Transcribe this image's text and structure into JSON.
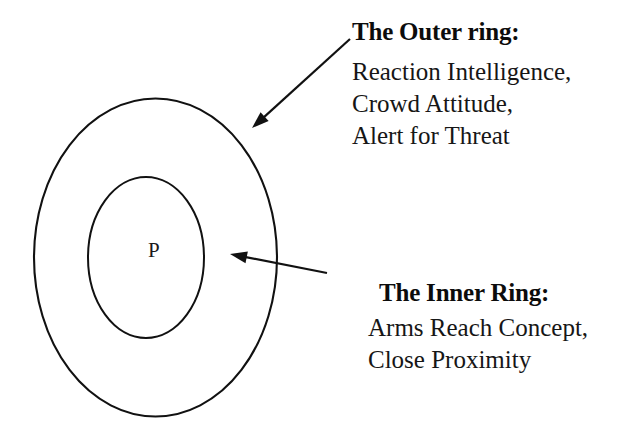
{
  "diagram": {
    "center_label": "P",
    "background_color": "#ffffff",
    "stroke_color": "#111111",
    "shapes": [
      {
        "name": "outer-ring",
        "type": "ellipse",
        "cx": 155.5,
        "cy": 257.5,
        "rx": 121.5,
        "ry": 159.0,
        "stroke_width": 2.1
      },
      {
        "name": "inner-ring",
        "type": "ellipse",
        "cx": 146.0,
        "cy": 257.5,
        "rx": 58.0,
        "ry": 80.5,
        "stroke_width": 2.0
      }
    ],
    "arrows": [
      {
        "name": "outer-ring-arrow",
        "from_x": 350,
        "from_y": 39,
        "to_x": 252,
        "to_y": 128,
        "points_to": "outer-ring"
      },
      {
        "name": "inner-ring-arrow",
        "from_x": 327,
        "from_y": 273,
        "to_x": 230,
        "to_y": 254,
        "points_to": "inner-ring"
      }
    ]
  },
  "callouts": {
    "outer": {
      "heading": "The Outer ring:",
      "lines": [
        "Reaction Intelligence,",
        "Crowd Attitude,",
        "Alert for Threat"
      ]
    },
    "inner": {
      "heading": "The Inner Ring:",
      "lines": [
        "Arms Reach Concept,",
        "Close Proximity"
      ]
    }
  }
}
